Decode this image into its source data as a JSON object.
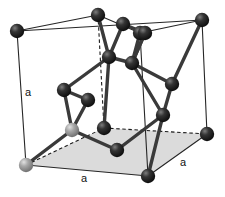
{
  "figure": {
    "background_color": "#ffffff"
  },
  "labels": [
    {
      "id": "a-left",
      "text": "a",
      "x": 28,
      "y": 96
    },
    {
      "id": "a-bottom",
      "text": "a",
      "x": 84,
      "y": 182
    },
    {
      "id": "a-right",
      "text": "a",
      "x": 183,
      "y": 166
    }
  ],
  "colors": {
    "cube_edge": "#262626",
    "dashed_edge": "#1a1a1a",
    "bond": "#3a3a3a",
    "atom_dark": "#1c1c1c",
    "atom_dark_highlight": "#6e6e6e",
    "atom_light": "#9a9a9a",
    "atom_light_highlight": "#d8d8d8",
    "base_face_fill": "#d9d9d9",
    "label_text": "#111111"
  },
  "geometry": {
    "cube_corners": [
      {
        "id": "top-back-left",
        "x": 17,
        "y": 31,
        "shade": "dark"
      },
      {
        "id": "top-back-right",
        "x": 202,
        "y": 20,
        "shade": "dark"
      },
      {
        "id": "top-front-left",
        "x": 98,
        "y": 15,
        "shade": "dark"
      },
      {
        "id": "top-front-right",
        "x": 140,
        "y": 33,
        "shade": "dark"
      },
      {
        "id": "bottom-back-left",
        "x": 26,
        "y": 165,
        "shade": "light"
      },
      {
        "id": "bottom-back-right",
        "x": 207,
        "y": 134,
        "shade": "dark"
      },
      {
        "id": "bottom-front-left",
        "x": 104,
        "y": 128,
        "shade": "dark"
      },
      {
        "id": "bottom-front-right",
        "x": 148,
        "y": 176,
        "shade": "dark"
      }
    ],
    "interior_atoms": [
      {
        "id": "int-top-a",
        "x": 123,
        "y": 24,
        "shade": "dark"
      },
      {
        "id": "int-top-b",
        "x": 145,
        "y": 33,
        "shade": "dark"
      },
      {
        "id": "int-mid-a",
        "x": 109,
        "y": 57,
        "shade": "dark"
      },
      {
        "id": "int-mid-b",
        "x": 132,
        "y": 63,
        "shade": "dark"
      },
      {
        "id": "int-left-a",
        "x": 64,
        "y": 90,
        "shade": "dark"
      },
      {
        "id": "int-left-b",
        "x": 88,
        "y": 100,
        "shade": "dark"
      },
      {
        "id": "int-right-a",
        "x": 172,
        "y": 84,
        "shade": "dark"
      },
      {
        "id": "int-right-b",
        "x": 163,
        "y": 115,
        "shade": "dark"
      },
      {
        "id": "int-low-left",
        "x": 72,
        "y": 130,
        "shade": "light"
      },
      {
        "id": "int-low-mid",
        "x": 117,
        "y": 150,
        "shade": "dark"
      }
    ],
    "base_face_polygon": "26,165 104,128 207,134 148,176",
    "cube_edges_solid": [
      "17,31 202,20",
      "17,31 98,15",
      "98,15 140,33",
      "140,33 202,20",
      "17,31 26,165",
      "202,20 207,134",
      "140,33 148,176",
      "26,165 148,176",
      "148,176 207,134"
    ],
    "cube_edges_dashed": [
      "98,15 104,128",
      "26,165 104,128",
      "104,128 207,134"
    ],
    "bonds": [
      "123,24 109,57",
      "123,24 145,33",
      "145,33 132,63",
      "109,57 132,63",
      "109,57 98,15",
      "132,63 140,33",
      "109,57 64,90",
      "64,90 88,100",
      "88,100 72,130",
      "64,90 72,130",
      "132,63 172,84",
      "172,84 163,115",
      "132,63 163,115",
      "172,84 202,20",
      "163,115 148,176",
      "72,130 26,165",
      "72,130 117,150",
      "117,150 163,115",
      "109,57 104,128",
      "132,63 145,33"
    ]
  }
}
